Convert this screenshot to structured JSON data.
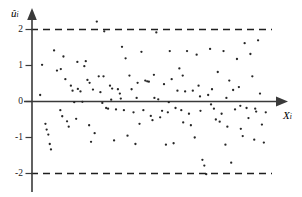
{
  "chart_data": {
    "type": "scatter",
    "title": "",
    "subtitle": "",
    "xlabel": "X_i",
    "ylabel": "u-hat_i",
    "xlabel_display": "X",
    "xlabel_sub": "i",
    "ylabel_display": "û",
    "ylabel_sub": "i",
    "grid": false,
    "legend": false,
    "xlim": [
      0,
      100
    ],
    "ylim": [
      -2.45,
      2.45
    ],
    "ytick_labels": [
      "2",
      "1",
      "0",
      "-1",
      "-2"
    ],
    "ytick_values": [
      2,
      1,
      0,
      -1,
      -2
    ],
    "xtick_labels": [],
    "annotations": [
      {
        "type": "hline",
        "value": 2,
        "style": "dashed",
        "label": "+2 standard deviation bound"
      },
      {
        "type": "hline",
        "value": -2,
        "style": "dashed",
        "label": "-2 standard deviation bound"
      },
      {
        "type": "hline",
        "value": 0,
        "style": "solid",
        "label": "zero residual axis"
      }
    ],
    "series": [
      {
        "name": "residuals",
        "marker": "dot",
        "color": "#262626",
        "points": [
          [
            3.4,
            0.18
          ],
          [
            4.2,
            1.02
          ],
          [
            5.6,
            -0.62
          ],
          [
            6.1,
            -0.78
          ],
          [
            6.8,
            -0.92
          ],
          [
            7.4,
            -1.18
          ],
          [
            7.9,
            -1.33
          ],
          [
            9.2,
            1.42
          ],
          [
            10.4,
            0.86
          ],
          [
            11.8,
            -0.24
          ],
          [
            12.6,
            -0.41
          ],
          [
            13.1,
            1.25
          ],
          [
            13.9,
            0.62
          ],
          [
            14.6,
            -0.55
          ],
          [
            15.3,
            -0.7
          ],
          [
            16.2,
            0.44
          ],
          [
            16.9,
            0.3
          ],
          [
            17.6,
            -0.02
          ],
          [
            18.4,
            -0.48
          ],
          [
            19.1,
            0.35
          ],
          [
            20.2,
            0.28
          ],
          [
            21.0,
            -0.01
          ],
          [
            21.8,
            0.98
          ],
          [
            22.4,
            1.12
          ],
          [
            23.1,
            0.6
          ],
          [
            23.8,
            -0.66
          ],
          [
            24.6,
            -1.12
          ],
          [
            25.4,
            0.33
          ],
          [
            26.1,
            -0.88
          ],
          [
            27.0,
            2.22
          ],
          [
            27.8,
            0.7
          ],
          [
            28.5,
            0.26
          ],
          [
            29.3,
            -0.04
          ],
          [
            30.1,
            1.95
          ],
          [
            30.9,
            -0.18
          ],
          [
            31.7,
            -0.2
          ],
          [
            32.5,
            0.44
          ],
          [
            33.4,
            0.36
          ],
          [
            34.2,
            -1.08
          ],
          [
            35.0,
            -0.22
          ],
          [
            35.8,
            0.34
          ],
          [
            36.6,
            0.22
          ],
          [
            37.5,
            1.52
          ],
          [
            38.3,
            -0.24
          ],
          [
            39.0,
            1.2
          ],
          [
            39.8,
            -0.95
          ],
          [
            40.6,
            0.72
          ],
          [
            41.5,
            0.34
          ],
          [
            42.3,
            -0.3
          ],
          [
            43.1,
            -1.18
          ],
          [
            44.0,
            0.52
          ],
          [
            44.8,
            -0.62
          ],
          [
            45.6,
            1.38
          ],
          [
            46.4,
            -0.24
          ],
          [
            47.2,
            0.58
          ],
          [
            48.0,
            0.56
          ],
          [
            48.7,
            0.55
          ],
          [
            49.5,
            -0.4
          ],
          [
            50.2,
            -0.52
          ],
          [
            51.0,
            0.1
          ],
          [
            51.8,
            1.92
          ],
          [
            52.6,
            0.06
          ],
          [
            53.4,
            -0.44
          ],
          [
            54.2,
            -0.26
          ],
          [
            55.0,
            0.48
          ],
          [
            55.8,
            -1.2
          ],
          [
            56.6,
            -0.3
          ],
          [
            57.4,
            1.4
          ],
          [
            58.2,
            0.62
          ],
          [
            59.0,
            -1.16
          ],
          [
            59.8,
            -0.18
          ],
          [
            60.6,
            0.3
          ],
          [
            61.4,
            0.92
          ],
          [
            62.2,
            -0.24
          ],
          [
            63.0,
            -0.58
          ],
          [
            63.8,
            0.28
          ],
          [
            64.6,
            1.4
          ],
          [
            65.4,
            -0.34
          ],
          [
            66.2,
            -0.66
          ],
          [
            67.0,
            0.3
          ],
          [
            67.8,
            -1.0
          ],
          [
            68.6,
            1.3
          ],
          [
            69.4,
            0.44
          ],
          [
            70.2,
            -0.26
          ],
          [
            71.0,
            -1.62
          ],
          [
            71.8,
            -1.78
          ],
          [
            72.6,
            -2.02
          ],
          [
            73.4,
            0.18
          ],
          [
            74.2,
            1.46
          ],
          [
            75.0,
            0.34
          ],
          [
            75.8,
            -0.2
          ],
          [
            76.6,
            -0.5
          ],
          [
            77.4,
            0.82
          ],
          [
            78.2,
            -0.56
          ],
          [
            79.0,
            -0.34
          ],
          [
            79.8,
            1.4
          ],
          [
            80.6,
            -1.2
          ],
          [
            81.4,
            -0.7
          ],
          [
            82.2,
            0.58
          ],
          [
            83.0,
            -1.7
          ],
          [
            83.8,
            0.32
          ],
          [
            84.6,
            -0.22
          ],
          [
            85.4,
            1.18
          ],
          [
            86.2,
            0.4
          ],
          [
            87.0,
            -0.76
          ],
          [
            87.8,
            -0.96
          ],
          [
            88.6,
            1.62
          ],
          [
            89.4,
            -0.18
          ],
          [
            90.2,
            -0.46
          ],
          [
            91.0,
            1.32
          ],
          [
            91.8,
            0.7
          ],
          [
            92.6,
            -1.06
          ],
          [
            93.4,
            -0.28
          ],
          [
            94.2,
            1.7
          ],
          [
            95.0,
            0.22
          ],
          [
            95.8,
            -0.64
          ],
          [
            96.6,
            -1.14
          ],
          [
            97.4,
            -0.3
          ],
          [
            12.0,
            0.9
          ],
          [
            18.9,
            1.1
          ],
          [
            24.0,
            0.52
          ],
          [
            29.8,
            0.7
          ],
          [
            33.0,
            0.05
          ],
          [
            37.0,
            0.08
          ],
          [
            43.6,
            0.1
          ],
          [
            50.8,
            0.74
          ],
          [
            57.0,
            -0.02
          ],
          [
            62.8,
            0.72
          ],
          [
            70.0,
            0.14
          ],
          [
            74.6,
            -0.08
          ],
          [
            81.0,
            0.1
          ],
          [
            86.8,
            -0.12
          ],
          [
            93.0,
            -0.2
          ]
        ]
      }
    ]
  },
  "axes": {
    "y_axis_name": "vertical-axis",
    "x_axis_name": "horizontal-axis"
  }
}
